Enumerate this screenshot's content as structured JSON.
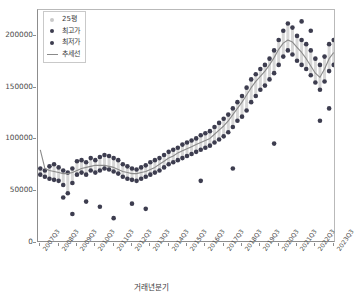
{
  "chart": {
    "type": "scatter",
    "xlabel": "거래년분기",
    "ylabel": "",
    "title": ""
  },
  "legend": {
    "position": "top-left",
    "items": [
      {
        "label": "25평",
        "marker": "circle",
        "color": "#c9c9c9",
        "name": "series-25pyeong"
      },
      {
        "label": "최고가",
        "marker": "circle",
        "color": "#3d3d4f",
        "name": "series-high-price"
      },
      {
        "label": "최저가",
        "marker": "circle",
        "color": "#3d3d4f",
        "name": "series-low-price"
      },
      {
        "label": "추세선",
        "marker": "line",
        "color": "#8a8a8a",
        "name": "series-trendline"
      }
    ]
  },
  "yaxis": {
    "ticks": [
      0,
      50000,
      100000,
      150000,
      200000
    ],
    "tick_labels": [
      "0",
      "50000",
      "100000",
      "150000",
      "200000"
    ],
    "min": 0,
    "max": 225000
  },
  "xaxis": {
    "tick_labels": [
      "2007Q3",
      "2008Q3",
      "2009Q3",
      "2010Q3",
      "2011Q3",
      "2012Q3",
      "2013Q3",
      "2014Q3",
      "2015Q3",
      "2016Q3",
      "2017Q3",
      "2018Q3",
      "2019Q3",
      "2020Q3",
      "2021Q3",
      "2022Q3",
      "2023Q3"
    ],
    "tick_positions": [
      0,
      4,
      8,
      12,
      16,
      20,
      24,
      28,
      32,
      36,
      40,
      44,
      48,
      52,
      56,
      60,
      64
    ],
    "min": 0,
    "max": 65
  },
  "chart_data": {
    "type": "scatter",
    "title": "",
    "xlabel": "거래년분기",
    "ylabel": "",
    "ylim": [
      0,
      225000
    ],
    "xlim": [
      0,
      65
    ],
    "grid": false,
    "legend_position": "top-left",
    "categories": [
      "2007Q3",
      "2007Q4",
      "2008Q1",
      "2008Q2",
      "2008Q3",
      "2008Q4",
      "2009Q1",
      "2009Q2",
      "2009Q3",
      "2009Q4",
      "2010Q1",
      "2010Q2",
      "2010Q3",
      "2010Q4",
      "2011Q1",
      "2011Q2",
      "2011Q3",
      "2011Q4",
      "2012Q1",
      "2012Q2",
      "2012Q3",
      "2012Q4",
      "2013Q1",
      "2013Q2",
      "2013Q3",
      "2013Q4",
      "2014Q1",
      "2014Q2",
      "2014Q3",
      "2014Q4",
      "2015Q1",
      "2015Q2",
      "2015Q3",
      "2015Q4",
      "2016Q1",
      "2016Q2",
      "2016Q3",
      "2016Q4",
      "2017Q1",
      "2017Q2",
      "2017Q3",
      "2017Q4",
      "2018Q1",
      "2018Q2",
      "2018Q3",
      "2018Q4",
      "2019Q1",
      "2019Q2",
      "2019Q3",
      "2019Q4",
      "2020Q1",
      "2020Q2",
      "2020Q3",
      "2020Q4",
      "2021Q1",
      "2021Q2",
      "2021Q3",
      "2021Q4",
      "2022Q1",
      "2022Q2",
      "2022Q3",
      "2022Q4",
      "2023Q1",
      "2023Q2",
      "2023Q3"
    ],
    "series": [
      {
        "name": "최고가",
        "color": "#3d3d4f",
        "marker": "circle",
        "values": [
          72000,
          70000,
          74000,
          76000,
          73000,
          70000,
          68000,
          72000,
          79000,
          80000,
          78000,
          82000,
          80000,
          83000,
          85000,
          84000,
          82000,
          80000,
          76000,
          74000,
          72000,
          71000,
          73000,
          75000,
          78000,
          80000,
          82000,
          85000,
          88000,
          90000,
          92000,
          95000,
          97000,
          99000,
          101000,
          104000,
          106000,
          108000,
          112000,
          116000,
          120000,
          124000,
          130000,
          136000,
          142000,
          150000,
          158000,
          163000,
          168000,
          172000,
          178000,
          186000,
          196000,
          205000,
          212000,
          208000,
          200000,
          196000,
          192000,
          186000,
          178000,
          172000,
          180000,
          192000,
          196000
        ]
      },
      {
        "name": "최저가",
        "color": "#3d3d4f",
        "marker": "circle",
        "values": [
          66000,
          64000,
          62000,
          61000,
          60000,
          56000,
          48000,
          58000,
          66000,
          68000,
          66000,
          70000,
          68000,
          70000,
          72000,
          71000,
          69000,
          67000,
          64000,
          62000,
          61000,
          60000,
          62000,
          64000,
          66000,
          68000,
          70000,
          73000,
          76000,
          78000,
          80000,
          82000,
          84000,
          86000,
          88000,
          90000,
          92000,
          94000,
          97000,
          100000,
          103000,
          107000,
          112000,
          118000,
          122000,
          128000,
          136000,
          142000,
          148000,
          152000,
          158000,
          164000,
          172000,
          180000,
          186000,
          182000,
          176000,
          172000,
          168000,
          162000,
          155000,
          148000,
          156000,
          166000,
          172000
        ]
      },
      {
        "name": "추세선",
        "color": "#8a8a8a",
        "marker": "line",
        "values": [
          90000,
          72000,
          70000,
          69000,
          68000,
          67000,
          67000,
          68000,
          70000,
          72000,
          73000,
          74000,
          75000,
          75000,
          75000,
          74000,
          73000,
          71000,
          69000,
          68000,
          67000,
          67000,
          68000,
          69000,
          71000,
          73000,
          76000,
          79000,
          82000,
          84000,
          87000,
          89000,
          91000,
          93000,
          95000,
          97000,
          99000,
          101000,
          105000,
          109000,
          113000,
          118000,
          124000,
          130000,
          136000,
          143000,
          150000,
          156000,
          161000,
          166000,
          172000,
          179000,
          187000,
          193000,
          196000,
          194000,
          189000,
          184000,
          178000,
          171000,
          164000,
          160000,
          168000,
          178000,
          184000
        ]
      }
    ],
    "outliers": [
      {
        "x": "2008Q4",
        "y": 44000
      },
      {
        "x": "2009Q2",
        "y": 28000
      },
      {
        "x": "2010Q1",
        "y": 40000
      },
      {
        "x": "2010Q4",
        "y": 35000
      },
      {
        "x": "2011Q3",
        "y": 24000
      },
      {
        "x": "2012Q3",
        "y": 38000
      },
      {
        "x": "2013Q2",
        "y": 33000
      },
      {
        "x": "2016Q2",
        "y": 60000
      },
      {
        "x": "2018Q1",
        "y": 72000
      },
      {
        "x": "2020Q2",
        "y": 96000
      },
      {
        "x": "2021Q4",
        "y": 214000
      },
      {
        "x": "2022Q2",
        "y": 205000
      },
      {
        "x": "2022Q4",
        "y": 118000
      },
      {
        "x": "2023Q2",
        "y": 130000
      }
    ]
  }
}
